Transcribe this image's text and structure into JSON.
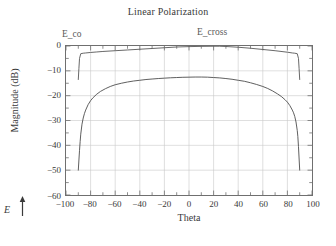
{
  "chart_data": {
    "type": "line",
    "title": "Linear Polarization",
    "xlabel": "Theta",
    "ylabel": "Magnitude (dB)",
    "xlim": [
      -100,
      100
    ],
    "ylim": [
      -60,
      0
    ],
    "xticks": [
      -100,
      -80,
      -60,
      -40,
      -20,
      0,
      20,
      40,
      60,
      80,
      100
    ],
    "xtick_labels": [
      "−100",
      "−80",
      "−60",
      "−40",
      "−20",
      "0",
      "20",
      "40",
      "60",
      "80",
      "100"
    ],
    "yticks": [
      0,
      -10,
      -20,
      -30,
      -40,
      -50,
      -60
    ],
    "ytick_labels": [
      "0",
      "−10",
      "−20",
      "−30",
      "−40",
      "−50",
      "−60"
    ],
    "x_minor_tick_step": 10,
    "y_minor_tick_step": 5,
    "grid": true,
    "grid_color": "#c9c9c9",
    "frame_color": "#6f6f6f",
    "legend": "inline-annotations",
    "annotations": [
      {
        "name": "E_co",
        "text": "E_co",
        "x": -86,
        "y": 1.5
      },
      {
        "name": "E_cross",
        "text": "E_cross",
        "x": 23,
        "y": 2.0
      },
      {
        "name": "polarization-indicator",
        "text": "E",
        "direction": "up"
      }
    ],
    "series": [
      {
        "name": "E_co",
        "color": "#555555",
        "x": [
          -90,
          -89.5,
          -89,
          -88,
          -86,
          -84,
          -80,
          -75,
          -70,
          -60,
          -50,
          -40,
          -30,
          -20,
          -10,
          0,
          10,
          20,
          25,
          30,
          40,
          50,
          60,
          70,
          80,
          84,
          86,
          88,
          89,
          89.5,
          90
        ],
        "y": [
          -13.5,
          -9.0,
          -5.0,
          -3.1,
          -2.9,
          -2.8,
          -2.6,
          -2.4,
          -2.2,
          -1.9,
          -1.6,
          -1.3,
          -1.0,
          -0.7,
          -0.4,
          -0.25,
          -0.15,
          -0.1,
          -0.1,
          -0.2,
          -0.5,
          -0.9,
          -1.4,
          -1.9,
          -2.5,
          -2.8,
          -2.9,
          -3.1,
          -5.0,
          -9.0,
          -13.5
        ]
      },
      {
        "name": "E_cross",
        "color": "#4a4a4a",
        "x": [
          -90,
          -89,
          -88.5,
          -88,
          -87,
          -86,
          -85,
          -84,
          -82,
          -80,
          -78,
          -75,
          -72,
          -68,
          -64,
          -60,
          -55,
          -50,
          -45,
          -40,
          -35,
          -30,
          -25,
          -20,
          -15,
          -10,
          -5,
          0,
          5,
          10,
          15,
          20,
          25,
          30,
          35,
          40,
          45,
          50,
          55,
          60,
          64,
          68,
          72,
          75,
          78,
          80,
          82,
          84,
          85,
          86,
          87,
          88,
          88.5,
          89,
          90
        ],
        "y": [
          -50.0,
          -42.0,
          -38.5,
          -35.5,
          -31.5,
          -29.0,
          -27.2,
          -25.8,
          -23.6,
          -22.0,
          -20.8,
          -19.4,
          -18.3,
          -17.2,
          -16.3,
          -15.6,
          -15.0,
          -14.5,
          -14.1,
          -13.8,
          -13.5,
          -13.3,
          -13.1,
          -12.95,
          -12.8,
          -12.7,
          -12.6,
          -12.55,
          -12.5,
          -12.5,
          -12.55,
          -12.7,
          -12.85,
          -13.1,
          -13.4,
          -13.8,
          -14.2,
          -14.8,
          -15.5,
          -16.3,
          -17.1,
          -18.1,
          -19.3,
          -20.3,
          -21.6,
          -22.6,
          -24.0,
          -25.8,
          -26.9,
          -28.4,
          -30.6,
          -34.0,
          -36.5,
          -40.5,
          -50.0
        ]
      }
    ]
  }
}
